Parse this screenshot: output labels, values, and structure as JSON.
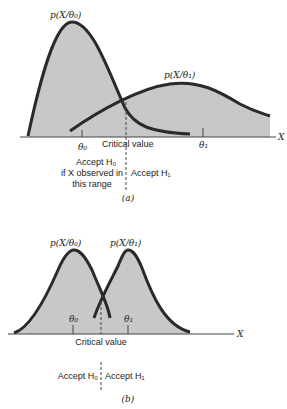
{
  "figure_a": {
    "pdf_h0_label": "p(X/θ₀)",
    "pdf_h1_label": "p(X/θ₁)",
    "theta0": "θ₀",
    "theta1": "θ₁",
    "critical_value": "Critical value",
    "axis_label": "X",
    "accept_h0_line1": "Accept H₀",
    "accept_h0_line2": "if X observed in",
    "accept_h0_line3": "this range",
    "accept_h1": "Accept H₁",
    "caption": "(a)"
  },
  "figure_b": {
    "pdf_h0_label": "p(X/θ₀)",
    "pdf_h1_label": "p(X/θ₁)",
    "theta0": "θ₀",
    "theta1": "θ₁",
    "critical_value": "Critical value",
    "axis_label": "X",
    "accept_h0": "Accept H₀",
    "accept_h1": "Accept H₁",
    "caption": "(b)"
  },
  "colors": {
    "fill": "#c8c8c8",
    "curve": "#2a2a2a",
    "axis": "#444444"
  }
}
